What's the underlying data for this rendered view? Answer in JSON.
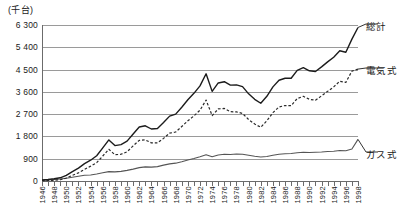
{
  "chart_data": {
    "type": "line",
    "title": "",
    "unit_label": "(千台)",
    "xlabel": "",
    "ylabel": "",
    "ylim": [
      0,
      6300
    ],
    "yticks": [
      0,
      900,
      1800,
      2700,
      3600,
      4500,
      5400,
      6300
    ],
    "ytick_labels": [
      "0",
      "900",
      "1 800",
      "2 700",
      "3 600",
      "4 500",
      "5 400",
      "6 300"
    ],
    "grid": true,
    "legend_position": "right-inline",
    "xlim": [
      1946,
      1998
    ],
    "x": [
      1946,
      1947,
      1948,
      1949,
      1950,
      1951,
      1952,
      1953,
      1954,
      1955,
      1956,
      1957,
      1958,
      1959,
      1960,
      1961,
      1962,
      1963,
      1964,
      1965,
      1966,
      1967,
      1968,
      1969,
      1970,
      1971,
      1972,
      1973,
      1974,
      1975,
      1976,
      1977,
      1978,
      1979,
      1980,
      1981,
      1982,
      1983,
      1984,
      1985,
      1986,
      1987,
      1988,
      1989,
      1990,
      1991,
      1992,
      1993,
      1994,
      1995,
      1996,
      1997,
      1998
    ],
    "xtick_labels": [
      "1946",
      "1948",
      "1950",
      "1952",
      "1954",
      "1956",
      "1958",
      "1960",
      "1962",
      "1964",
      "1966",
      "1968",
      "1970",
      "1972",
      "1974",
      "1976",
      "1978",
      "1980",
      "1982",
      "1984",
      "1986",
      "1988",
      "1990",
      "1992",
      "1994",
      "1996",
      "1998"
    ],
    "series": [
      {
        "name": "総計",
        "style": "solid",
        "values": [
          40,
          60,
          90,
          130,
          230,
          380,
          520,
          700,
          840,
          1020,
          1340,
          1660,
          1430,
          1470,
          1610,
          1900,
          2180,
          2230,
          2100,
          2120,
          2360,
          2620,
          2700,
          2980,
          3280,
          3540,
          3840,
          4330,
          3620,
          3960,
          4010,
          3870,
          3880,
          3810,
          3520,
          3300,
          3140,
          3420,
          3800,
          4070,
          4150,
          4150,
          4470,
          4580,
          4450,
          4420,
          4610,
          4810,
          5000,
          5260,
          5200,
          5730,
          6200
        ]
      },
      {
        "name": "電気式",
        "style": "dashed",
        "values": [
          10,
          20,
          30,
          50,
          120,
          230,
          330,
          470,
          600,
          740,
          1010,
          1280,
          1060,
          1080,
          1180,
          1420,
          1640,
          1660,
          1540,
          1540,
          1720,
          1930,
          1980,
          2200,
          2430,
          2630,
          2860,
          3270,
          2640,
          2910,
          2930,
          2800,
          2790,
          2730,
          2480,
          2300,
          2170,
          2430,
          2760,
          2990,
          3050,
          3040,
          3330,
          3420,
          3300,
          3260,
          3440,
          3620,
          3800,
          4030,
          3980,
          4440,
          4520
        ]
      },
      {
        "name": "ガス式",
        "style": "solid-thin",
        "values": [
          30,
          40,
          60,
          80,
          110,
          150,
          190,
          230,
          240,
          280,
          330,
          380,
          370,
          390,
          430,
          480,
          540,
          570,
          560,
          580,
          640,
          690,
          720,
          780,
          850,
          910,
          980,
          1060,
          980,
          1050,
          1080,
          1070,
          1090,
          1080,
          1040,
          1000,
          970,
          990,
          1040,
          1080,
          1100,
          1110,
          1140,
          1160,
          1150,
          1160,
          1170,
          1190,
          1200,
          1230,
          1220,
          1290,
          1680
        ]
      }
    ]
  },
  "legend": {
    "total_label": "総計",
    "electric_label": "電気式",
    "gas_label": "ガス式"
  }
}
